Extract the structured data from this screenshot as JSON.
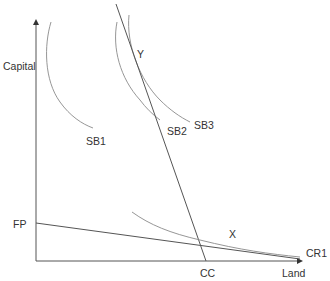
{
  "diagram": {
    "axes": {
      "y_label": "Capital",
      "x_label": "Land"
    },
    "curves": {
      "sb1": "SB1",
      "sb2": "SB2",
      "sb3": "SB3",
      "x_curve": "X"
    },
    "lines": {
      "fp": "FP",
      "cr1": "CR1",
      "cc": "CC"
    },
    "points": {
      "y": "Y",
      "x": "X"
    },
    "colors": {
      "axis": "#555555",
      "curve": "#8a8a8a",
      "text": "#333333"
    }
  }
}
